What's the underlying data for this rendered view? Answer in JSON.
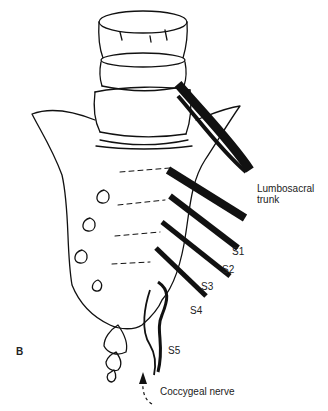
{
  "figure": {
    "panel_label": "B",
    "labels": {
      "lumbosacral_line1": "Lumbosacral",
      "lumbosacral_line2": "trunk",
      "s1": "S1",
      "s2": "S2",
      "s3": "S3",
      "s4": "S4",
      "s5": "S5",
      "coccygeal": "Coccygeal nerve"
    }
  }
}
